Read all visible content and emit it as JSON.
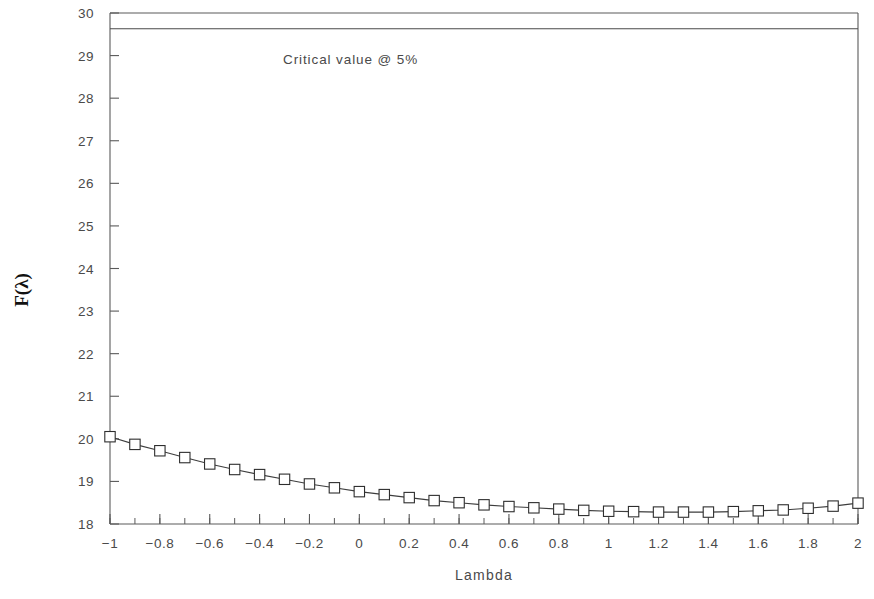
{
  "chart_data": {
    "type": "line",
    "title": "",
    "xlabel": "Lambda",
    "ylabel": "F(λ)",
    "xlim": [
      -1,
      2
    ],
    "ylim": [
      18,
      30
    ],
    "grid": false,
    "legend": null,
    "x_ticks": [
      "-1",
      "-0.8",
      "-0.6",
      "-0.4",
      "-0.2",
      "0",
      "0.2",
      "0.4",
      "0.6",
      "0.8",
      "1",
      "1.2",
      "1.4",
      "1.6",
      "1.8",
      "2"
    ],
    "x_tick_values": [
      -1,
      -0.8,
      -0.6,
      -0.4,
      -0.2,
      0,
      0.2,
      0.4,
      0.6,
      0.8,
      1,
      1.2,
      1.4,
      1.6,
      1.8,
      2
    ],
    "x_minor_step": 0.1,
    "y_ticks": [
      "18",
      "19",
      "20",
      "21",
      "22",
      "23",
      "24",
      "25",
      "26",
      "27",
      "28",
      "29",
      "30"
    ],
    "y_tick_values": [
      18,
      19,
      20,
      21,
      22,
      23,
      24,
      25,
      26,
      27,
      28,
      29,
      30
    ],
    "marker": "open-square",
    "series": [
      {
        "name": "F(lambda)",
        "x": [
          -1,
          -0.9,
          -0.8,
          -0.7,
          -0.6,
          -0.5,
          -0.4,
          -0.3,
          -0.2,
          -0.1,
          0,
          0.1,
          0.2,
          0.3,
          0.4,
          0.5,
          0.6,
          0.7,
          0.8,
          0.9,
          1,
          1.1,
          1.2,
          1.3,
          1.4,
          1.5,
          1.6,
          1.7,
          1.8,
          1.9,
          2
        ],
        "values": [
          20.05,
          19.87,
          19.72,
          19.56,
          19.41,
          19.28,
          19.16,
          19.05,
          18.94,
          18.85,
          18.76,
          18.69,
          18.62,
          18.55,
          18.5,
          18.45,
          18.41,
          18.38,
          18.35,
          18.32,
          18.3,
          18.29,
          18.28,
          18.28,
          18.28,
          18.29,
          18.31,
          18.33,
          18.37,
          18.42,
          18.49
        ]
      }
    ],
    "reference_line": {
      "label": "Critical value @ 5%",
      "value": 29.63,
      "orientation": "horizontal"
    }
  }
}
